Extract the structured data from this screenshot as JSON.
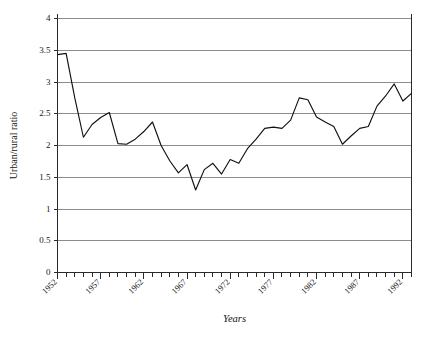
{
  "chart_data": {
    "type": "line",
    "title": "",
    "xlabel": "Years",
    "ylabel": "Urban/rural ratio",
    "xlim": [
      1952,
      1993
    ],
    "ylim": [
      0,
      4
    ],
    "grid": true,
    "legend": "none",
    "y_ticks": [
      0,
      0.5,
      1,
      1.5,
      2,
      2.5,
      3,
      3.5,
      4
    ],
    "y_tick_labels": [
      "0",
      "0.5",
      "1",
      "1.5",
      "2",
      "2.5",
      "3",
      "3.5",
      "4"
    ],
    "x_ticks": [
      1952,
      1957,
      1962,
      1967,
      1972,
      1977,
      1982,
      1987,
      1992
    ],
    "x_tick_labels": [
      "1952",
      "1957",
      "1962",
      "1967",
      "1972",
      "1977",
      "1982",
      "1987",
      "1992"
    ],
    "x_minor_tick_interval": 1,
    "line_color": "#111111",
    "gridline_color": "#8c8c8c",
    "axis_color": "#2b2b2b",
    "x": [
      1952,
      1953,
      1954,
      1955,
      1956,
      1957,
      1958,
      1959,
      1960,
      1961,
      1962,
      1963,
      1964,
      1965,
      1966,
      1967,
      1968,
      1969,
      1970,
      1971,
      1972,
      1973,
      1974,
      1975,
      1976,
      1977,
      1978,
      1979,
      1980,
      1981,
      1982,
      1983,
      1984,
      1985,
      1986,
      1987,
      1988,
      1989,
      1990,
      1991,
      1992,
      1993
    ],
    "values": [
      3.43,
      3.45,
      2.75,
      2.13,
      2.33,
      2.44,
      2.52,
      2.03,
      2.02,
      2.1,
      2.22,
      2.37,
      2.0,
      1.76,
      1.57,
      1.7,
      1.3,
      1.62,
      1.72,
      1.55,
      1.78,
      1.72,
      1.95,
      2.1,
      2.27,
      2.29,
      2.27,
      2.4,
      2.75,
      2.72,
      2.45,
      2.37,
      2.3,
      2.02,
      2.15,
      2.27,
      2.3,
      2.62,
      2.78,
      2.97,
      2.7,
      2.82
    ],
    "series": [
      {
        "name": "Urban/rural ratio",
        "values": [
          3.43,
          3.45,
          2.75,
          2.13,
          2.33,
          2.44,
          2.52,
          2.03,
          2.02,
          2.1,
          2.22,
          2.37,
          2.0,
          1.76,
          1.57,
          1.7,
          1.3,
          1.62,
          1.72,
          1.55,
          1.78,
          1.72,
          1.95,
          2.1,
          2.27,
          2.29,
          2.27,
          2.4,
          2.75,
          2.72,
          2.45,
          2.37,
          2.3,
          2.02,
          2.15,
          2.27,
          2.3,
          2.62,
          2.78,
          2.97,
          2.7,
          2.82
        ]
      }
    ]
  }
}
